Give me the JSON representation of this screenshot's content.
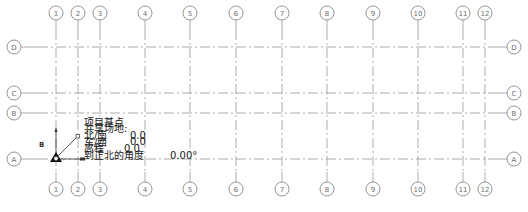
{
  "drawing": {
    "line_color": "#8a8a8a",
    "bubble_color": "#7a7a7a",
    "text_color": "#1a1a1a",
    "vertical_grids": [
      {
        "label": "1",
        "x": 56
      },
      {
        "label": "2",
        "x": 78
      },
      {
        "label": "3",
        "x": 100
      },
      {
        "label": "4",
        "x": 145
      },
      {
        "label": "5",
        "x": 190
      },
      {
        "label": "6",
        "x": 236
      },
      {
        "label": "7",
        "x": 282
      },
      {
        "label": "8",
        "x": 327
      },
      {
        "label": "9",
        "x": 373
      },
      {
        "label": "10",
        "x": 418
      },
      {
        "label": "11",
        "x": 463
      },
      {
        "label": "12",
        "x": 485
      }
    ],
    "horizontal_grids": [
      {
        "label": "D",
        "y": 47
      },
      {
        "label": "C",
        "y": 93
      },
      {
        "label": "B",
        "y": 113
      },
      {
        "label": "A",
        "y": 159
      }
    ]
  },
  "base_point": {
    "title": "项目基点",
    "shared_site": "共享场地:",
    "north_south_label": "北/南",
    "north_south_value": "0.0",
    "east_west_label": "东/西",
    "east_west_value": "0.0",
    "elevation_label": "高程",
    "elevation_value": "0.0",
    "angle_label": "到正北的角度",
    "angle_value": "0.00°",
    "marker_label": "B"
  }
}
